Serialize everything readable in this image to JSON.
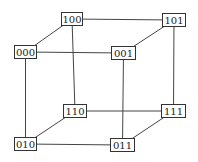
{
  "diagram": {
    "type": "hypercube-3d",
    "nodes": [
      {
        "id": "100",
        "label": "100",
        "x": 61,
        "y": 12,
        "w": 22,
        "h": 14
      },
      {
        "id": "101",
        "label": "101",
        "x": 162,
        "y": 13,
        "w": 24,
        "h": 14
      },
      {
        "id": "000",
        "label": "000",
        "x": 14,
        "y": 45,
        "w": 23,
        "h": 14
      },
      {
        "id": "001",
        "label": "001",
        "x": 111,
        "y": 46,
        "w": 25,
        "h": 14
      },
      {
        "id": "110",
        "label": "110",
        "x": 63,
        "y": 104,
        "w": 24,
        "h": 14
      },
      {
        "id": "111",
        "label": "111",
        "x": 161,
        "y": 104,
        "w": 25,
        "h": 14
      },
      {
        "id": "010",
        "label": "010",
        "x": 14,
        "y": 137,
        "w": 23,
        "h": 14
      },
      {
        "id": "011",
        "label": "011",
        "x": 110,
        "y": 138,
        "w": 25,
        "h": 14
      }
    ],
    "edges": [
      [
        "000",
        "001"
      ],
      [
        "000",
        "100"
      ],
      [
        "000",
        "010"
      ],
      [
        "001",
        "101"
      ],
      [
        "001",
        "011"
      ],
      [
        "100",
        "101"
      ],
      [
        "100",
        "110"
      ],
      [
        "101",
        "111"
      ],
      [
        "010",
        "011"
      ],
      [
        "010",
        "110"
      ],
      [
        "011",
        "111"
      ],
      [
        "110",
        "111"
      ]
    ],
    "line_color": "#444444",
    "border_color": "#333333"
  }
}
